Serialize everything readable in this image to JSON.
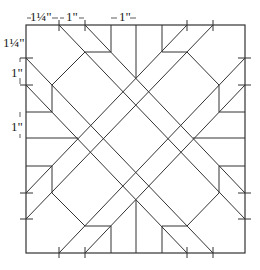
{
  "diagram": {
    "stroke_color": "#333333",
    "background": "#ffffff",
    "frame": {
      "x1": 26,
      "y1": 25,
      "x2": 245,
      "y2": 253
    },
    "dimension_labels": [
      {
        "id": "top-1",
        "text": "1¼\"",
        "x": 30,
        "y": 21,
        "anchor": "start"
      },
      {
        "id": "top-2",
        "text": "1\"",
        "x": 66,
        "y": 21,
        "anchor": "start"
      },
      {
        "id": "top-3",
        "text": "1\"",
        "x": 119,
        "y": 21,
        "anchor": "start"
      },
      {
        "id": "left-1",
        "text": "1¼\"",
        "x": 3,
        "y": 47,
        "anchor": "start"
      },
      {
        "id": "left-2",
        "text": "1\"",
        "x": 11,
        "y": 77,
        "anchor": "start"
      },
      {
        "id": "left-3",
        "text": "1\"",
        "x": 11,
        "y": 131,
        "anchor": "start"
      }
    ],
    "dimension_arrows": [
      {
        "x1": 27,
        "y1": 18,
        "x2": 31,
        "y2": 18
      },
      {
        "x1": 52,
        "y1": 18,
        "x2": 58,
        "y2": 18
      },
      {
        "x1": 60,
        "y1": 18,
        "x2": 64,
        "y2": 18
      },
      {
        "x1": 79,
        "y1": 18,
        "x2": 84,
        "y2": 18
      },
      {
        "x1": 111,
        "y1": 18,
        "x2": 117,
        "y2": 18
      },
      {
        "x1": 130,
        "y1": 18,
        "x2": 136,
        "y2": 18
      },
      {
        "x1": 20,
        "y1": 78,
        "x2": 20,
        "y2": 84
      },
      {
        "x1": 20,
        "y1": 58,
        "x2": 20,
        "y2": 62
      },
      {
        "x1": 20,
        "y1": 112,
        "x2": 20,
        "y2": 117
      },
      {
        "x1": 20,
        "y1": 134,
        "x2": 20,
        "y2": 138
      }
    ],
    "ticks": [
      {
        "x1": 59,
        "y1": 20,
        "x2": 59,
        "y2": 31
      },
      {
        "x1": 85,
        "y1": 20,
        "x2": 85,
        "y2": 31
      },
      {
        "x1": 187,
        "y1": 20,
        "x2": 187,
        "y2": 31
      },
      {
        "x1": 213,
        "y1": 20,
        "x2": 213,
        "y2": 31
      },
      {
        "x1": 59,
        "y1": 247,
        "x2": 59,
        "y2": 258
      },
      {
        "x1": 85,
        "y1": 247,
        "x2": 85,
        "y2": 258
      },
      {
        "x1": 187,
        "y1": 247,
        "x2": 187,
        "y2": 258
      },
      {
        "x1": 213,
        "y1": 247,
        "x2": 213,
        "y2": 258
      },
      {
        "x1": 20,
        "y1": 58,
        "x2": 33,
        "y2": 58
      },
      {
        "x1": 20,
        "y1": 85,
        "x2": 33,
        "y2": 85
      },
      {
        "x1": 20,
        "y1": 193,
        "x2": 33,
        "y2": 193
      },
      {
        "x1": 20,
        "y1": 219,
        "x2": 33,
        "y2": 219
      },
      {
        "x1": 238,
        "y1": 58,
        "x2": 251,
        "y2": 58
      },
      {
        "x1": 238,
        "y1": 85,
        "x2": 251,
        "y2": 85
      },
      {
        "x1": 238,
        "y1": 193,
        "x2": 251,
        "y2": 193
      },
      {
        "x1": 238,
        "y1": 219,
        "x2": 251,
        "y2": 219
      }
    ],
    "lines": [
      {
        "name": "diag-down-1",
        "x1": 59,
        "y1": 25,
        "x2": 245,
        "y2": 219
      },
      {
        "name": "diag-down-2",
        "x1": 85,
        "y1": 25,
        "x2": 245,
        "y2": 193
      },
      {
        "name": "diag-down-3",
        "x1": 26,
        "y1": 58,
        "x2": 213,
        "y2": 253
      },
      {
        "name": "diag-down-4",
        "x1": 26,
        "y1": 85,
        "x2": 187,
        "y2": 253
      },
      {
        "name": "diag-up-1",
        "x1": 213,
        "y1": 25,
        "x2": 26,
        "y2": 219
      },
      {
        "name": "diag-up-2",
        "x1": 187,
        "y1": 25,
        "x2": 26,
        "y2": 193
      },
      {
        "name": "diag-up-3",
        "x1": 245,
        "y1": 58,
        "x2": 59,
        "y2": 253
      },
      {
        "name": "diag-up-4",
        "x1": 245,
        "y1": 85,
        "x2": 85,
        "y2": 253
      },
      {
        "name": "notch-tl-v",
        "x1": 111,
        "y1": 25,
        "x2": 111,
        "y2": 52
      },
      {
        "name": "notch-tl-h",
        "x1": 85,
        "y1": 52,
        "x2": 111,
        "y2": 52
      },
      {
        "name": "notch-tr-v",
        "x1": 162,
        "y1": 25,
        "x2": 162,
        "y2": 52
      },
      {
        "name": "notch-tr-h",
        "x1": 162,
        "y1": 52,
        "x2": 187,
        "y2": 52
      },
      {
        "name": "notch-bl-v",
        "x1": 111,
        "y1": 226,
        "x2": 111,
        "y2": 253
      },
      {
        "name": "notch-bl-h",
        "x1": 85,
        "y1": 226,
        "x2": 111,
        "y2": 226
      },
      {
        "name": "notch-br-v",
        "x1": 162,
        "y1": 226,
        "x2": 162,
        "y2": 253
      },
      {
        "name": "notch-br-h",
        "x1": 162,
        "y1": 226,
        "x2": 187,
        "y2": 226
      },
      {
        "name": "notch-lt-v",
        "x1": 52,
        "y1": 85,
        "x2": 52,
        "y2": 112
      },
      {
        "name": "notch-lt-h",
        "x1": 26,
        "y1": 112,
        "x2": 52,
        "y2": 112
      },
      {
        "name": "notch-lb-v",
        "x1": 52,
        "y1": 166,
        "x2": 52,
        "y2": 193
      },
      {
        "name": "notch-lb-h",
        "x1": 26,
        "y1": 166,
        "x2": 52,
        "y2": 166
      },
      {
        "name": "notch-rt-v",
        "x1": 219,
        "y1": 85,
        "x2": 219,
        "y2": 112
      },
      {
        "name": "notch-rt-h",
        "x1": 219,
        "y1": 112,
        "x2": 245,
        "y2": 112
      },
      {
        "name": "notch-rb-v",
        "x1": 219,
        "y1": 166,
        "x2": 219,
        "y2": 193
      },
      {
        "name": "notch-rb-h",
        "x1": 219,
        "y1": 166,
        "x2": 245,
        "y2": 166
      },
      {
        "name": "oct-tl-a",
        "x1": 85,
        "y1": 52,
        "x2": 52,
        "y2": 85
      },
      {
        "name": "oct-tr-a",
        "x1": 187,
        "y1": 52,
        "x2": 219,
        "y2": 85
      },
      {
        "name": "oct-bl-a",
        "x1": 52,
        "y1": 193,
        "x2": 85,
        "y2": 226
      },
      {
        "name": "oct-br-a",
        "x1": 219,
        "y1": 193,
        "x2": 187,
        "y2": 226
      },
      {
        "name": "center-top-v",
        "x1": 136,
        "y1": 25,
        "x2": 136,
        "y2": 78
      },
      {
        "name": "center-bottom-v",
        "x1": 136,
        "y1": 200,
        "x2": 136,
        "y2": 253
      },
      {
        "name": "center-left-h",
        "x1": 26,
        "y1": 138,
        "x2": 78,
        "y2": 138
      },
      {
        "name": "center-right-h",
        "x1": 193,
        "y1": 138,
        "x2": 245,
        "y2": 138
      }
    ]
  }
}
